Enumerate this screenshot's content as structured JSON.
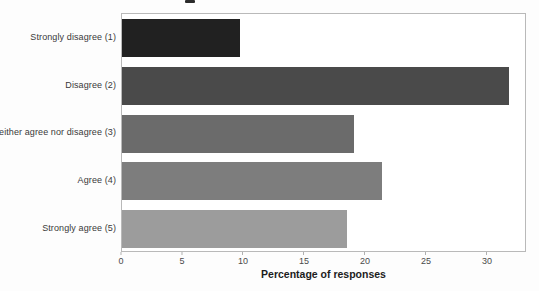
{
  "chart_data": {
    "type": "bar",
    "orientation": "horizontal",
    "title": "",
    "title_note": "title cropped out of frame at top of image",
    "categories": [
      "Strongly disagree (1)",
      "Disagree (2)",
      "Neither agree nor disagree (3)",
      "Agree (4)",
      "Strongly agree (5)"
    ],
    "values": [
      9.7,
      31.9,
      19.1,
      21.4,
      18.5
    ],
    "bar_colors": [
      "#212121",
      "#4a4a4a",
      "#6b6b6b",
      "#7d7d7d",
      "#9c9c9c"
    ],
    "xlabel": "Percentage of responses",
    "ylabel": "",
    "xlim": [
      0,
      33.2
    ],
    "x_ticks": [
      0,
      5,
      10,
      15,
      20,
      25,
      30
    ],
    "grid": false,
    "legend": false,
    "plot_border_color": "#b9b9b9",
    "background_color": "#ffffff"
  }
}
